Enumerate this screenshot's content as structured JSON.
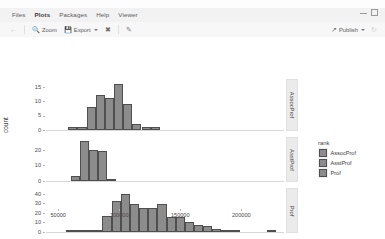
{
  "window": {
    "tabs": [
      {
        "label": "Files",
        "active": false
      },
      {
        "label": "Plots",
        "active": true
      },
      {
        "label": "Packages",
        "active": false
      },
      {
        "label": "Help",
        "active": false
      },
      {
        "label": "Viewer",
        "active": false
      }
    ],
    "minimize_icon": "minimize-icon",
    "maximize_icon": "maximize-icon"
  },
  "toolbar": {
    "back_icon": "back-arrow-icon",
    "zoom_label": "Zoom",
    "zoom_icon": "magnifier-icon",
    "export_label": "Export",
    "export_icon": "export-icon",
    "clear_icon": "clear-plot-icon",
    "brush_icon": "brush-icon",
    "publish_label": "Publish",
    "publish_icon": "publish-icon",
    "refresh_icon": "refresh-icon"
  },
  "chart_data": {
    "type": "bar",
    "title": "",
    "subtitle": "",
    "xlabel": "salary",
    "ylabel": "count",
    "grid": false,
    "legend_position": "right",
    "legend_title": "rank",
    "legend_entries": [
      "AssocProf",
      "AsstProf",
      "Prof"
    ],
    "facet_variable": "rank",
    "facet_strip_position": "right",
    "xlim": [
      40000,
      235000
    ],
    "xticks": [
      50000,
      100000,
      150000,
      200000
    ],
    "xtick_labels": [
      "50000",
      "100000",
      "150000",
      "200000"
    ],
    "bin_width": 7500,
    "accent_color": "#8c8c8c",
    "bar_outline_color": "#4f4f4f",
    "strip_bg_color": "#ebebeb",
    "panels": [
      {
        "name": "AssocProf",
        "strip_label": "AssocProf",
        "ylim": [
          0,
          17
        ],
        "yticks": [
          0,
          5,
          10,
          15
        ],
        "ytick_labels": [
          "0",
          "5",
          "10",
          "15"
        ],
        "bins": [
          {
            "x": 62000,
            "count": 1
          },
          {
            "x": 69500,
            "count": 1
          },
          {
            "x": 77000,
            "count": 8
          },
          {
            "x": 84500,
            "count": 12
          },
          {
            "x": 92000,
            "count": 11
          },
          {
            "x": 99500,
            "count": 16
          },
          {
            "x": 107000,
            "count": 9
          },
          {
            "x": 114500,
            "count": 2
          },
          {
            "x": 122000,
            "count": 1
          },
          {
            "x": 129500,
            "count": 1
          }
        ]
      },
      {
        "name": "AsstProf",
        "strip_label": "AsstProf",
        "ylim": [
          0,
          27
        ],
        "yticks": [
          0,
          10,
          20
        ],
        "ytick_labels": [
          "0",
          "10",
          "20"
        ],
        "bins": [
          {
            "x": 64000,
            "count": 3
          },
          {
            "x": 71500,
            "count": 26
          },
          {
            "x": 79000,
            "count": 20
          },
          {
            "x": 86500,
            "count": 19
          },
          {
            "x": 94000,
            "count": 1
          }
        ]
      },
      {
        "name": "Prof",
        "strip_label": "Prof",
        "ylim": [
          0,
          44
        ],
        "yticks": [
          0,
          10,
          20,
          30,
          40
        ],
        "ytick_labels": [
          "0",
          "10",
          "20",
          "30",
          "40"
        ],
        "bins": [
          {
            "x": 60000,
            "count": 1
          },
          {
            "x": 67500,
            "count": 2
          },
          {
            "x": 75000,
            "count": 2
          },
          {
            "x": 82500,
            "count": 2
          },
          {
            "x": 90000,
            "count": 17
          },
          {
            "x": 97500,
            "count": 33
          },
          {
            "x": 105000,
            "count": 40
          },
          {
            "x": 112500,
            "count": 29
          },
          {
            "x": 120000,
            "count": 25
          },
          {
            "x": 127500,
            "count": 25
          },
          {
            "x": 135000,
            "count": 29
          },
          {
            "x": 142500,
            "count": 16
          },
          {
            "x": 150000,
            "count": 16
          },
          {
            "x": 157500,
            "count": 11
          },
          {
            "x": 165000,
            "count": 7
          },
          {
            "x": 172500,
            "count": 6
          },
          {
            "x": 180000,
            "count": 3
          },
          {
            "x": 187500,
            "count": 2
          },
          {
            "x": 195000,
            "count": 1
          },
          {
            "x": 225000,
            "count": 1
          }
        ]
      }
    ]
  }
}
